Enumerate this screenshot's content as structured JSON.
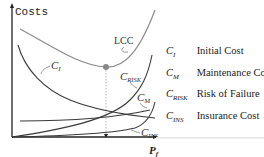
{
  "diagram": {
    "y_axis_label": "Costs",
    "x_axis_label": "P",
    "x_axis_label_sub": "f",
    "curve_labels": {
      "lcc": "LCC",
      "ci": {
        "main": "C",
        "sub": "I"
      },
      "crisk": {
        "main": "C",
        "sub": "RISK"
      },
      "cm": {
        "main": "C",
        "sub": "M"
      },
      "cins": {
        "main": "C",
        "sub": "INS"
      }
    },
    "colors": {
      "lcc": "#8a8a8a",
      "curves": "#3a3a3a",
      "axis": "#222222",
      "optimum_point": "#888888"
    }
  },
  "legend": [
    {
      "symbol": "C",
      "sub": "I",
      "label": "Initial Cost"
    },
    {
      "symbol": "C",
      "sub": "M",
      "label": "Maintenance Cost"
    },
    {
      "symbol": "C",
      "sub": "RISK",
      "label": "Risk of Failure"
    },
    {
      "symbol": "C",
      "sub": "INS",
      "label": "Insurance Cost"
    }
  ]
}
